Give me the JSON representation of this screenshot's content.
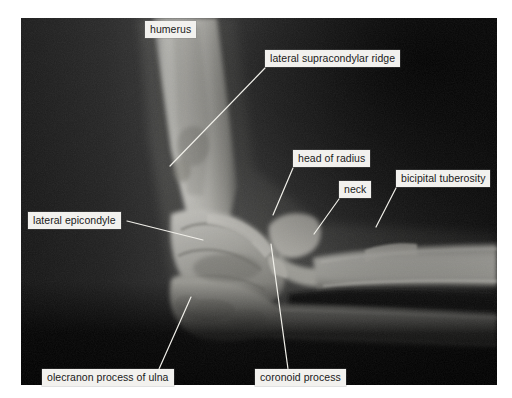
{
  "figure": {
    "type": "radiograph",
    "background_color": "#ffffff",
    "photo_border_color": "#0d0d0d",
    "label_box_color": "#f2f1ee",
    "label_text_color": "#1a1a1a",
    "leader_line_color": "#f0efe9"
  },
  "labels": [
    {
      "id": "humerus",
      "text": "humerus",
      "x": 145,
      "y": 21,
      "has_leader": false
    },
    {
      "id": "lateral-supracondylar-ridge",
      "text": "lateral supracondylar ridge",
      "x": 265,
      "y": 50,
      "has_leader": true,
      "leader": {
        "x1": 265,
        "y1": 68,
        "x2": 170,
        "y2": 166
      }
    },
    {
      "id": "head-of-radius",
      "text": "head of radius",
      "x": 293,
      "y": 150,
      "has_leader": true,
      "leader": {
        "x1": 293,
        "y1": 168,
        "x2": 273,
        "y2": 215
      }
    },
    {
      "id": "neck",
      "text": "neck",
      "x": 339,
      "y": 181,
      "has_leader": true,
      "leader": {
        "x1": 339,
        "y1": 199,
        "x2": 314,
        "y2": 234
      }
    },
    {
      "id": "bicipital-tuberosity",
      "text": "bicipital tuberosity",
      "x": 396,
      "y": 170,
      "has_leader": true,
      "leader": {
        "x1": 396,
        "y1": 188,
        "x2": 376,
        "y2": 227
      }
    },
    {
      "id": "lateral-epicondyle",
      "text": "lateral epicondyle",
      "x": 28,
      "y": 212,
      "has_leader": true,
      "leader": {
        "x1": 127,
        "y1": 221,
        "x2": 203,
        "y2": 240
      }
    },
    {
      "id": "olecranon-process-of-ulna",
      "text": "olecranon process of ulna",
      "x": 42,
      "y": 369,
      "has_leader": true,
      "leader": {
        "x1": 159,
        "y1": 369,
        "x2": 191,
        "y2": 297
      }
    },
    {
      "id": "coronoid-process",
      "text": "coronoid process",
      "x": 255,
      "y": 369,
      "has_leader": true,
      "leader": {
        "x1": 288,
        "y1": 369,
        "x2": 271,
        "y2": 244
      }
    }
  ]
}
